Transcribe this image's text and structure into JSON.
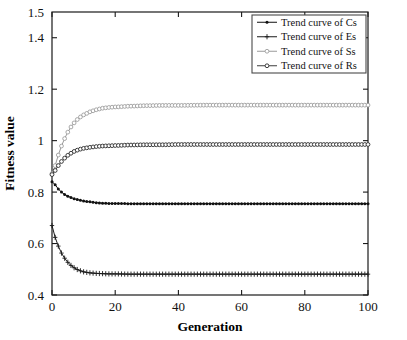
{
  "chart_data": {
    "type": "line",
    "title": "",
    "xlabel": "Generation",
    "ylabel": "Fitness value",
    "xlim": [
      0,
      100
    ],
    "ylim": [
      0.4,
      1.5
    ],
    "xticks": [
      0,
      20,
      40,
      60,
      80,
      100
    ],
    "xtick_labels": [
      "0",
      "20",
      "40",
      "60",
      "80",
      "100"
    ],
    "yticks": [
      0.4,
      0.6,
      0.8,
      1.0,
      1.2,
      1.4,
      1.5
    ],
    "ytick_labels": [
      "0.4",
      "0.6",
      "0.8",
      "1",
      "1.2",
      "1.4",
      "1.5"
    ],
    "grid": false,
    "legend_position": "upper right",
    "x": [
      0,
      1,
      2,
      3,
      4,
      5,
      6,
      7,
      8,
      9,
      10,
      12,
      14,
      16,
      18,
      20,
      25,
      30,
      35,
      40,
      50,
      60,
      70,
      80,
      90,
      100
    ],
    "series": [
      {
        "name": "Trend curve of Cs",
        "short_name": "Cs",
        "marker": "filled-dot",
        "color": "#111111",
        "values": [
          0.84,
          0.829,
          0.812,
          0.8,
          0.791,
          0.784,
          0.779,
          0.774,
          0.771,
          0.768,
          0.765,
          0.762,
          0.759,
          0.757,
          0.756,
          0.756,
          0.755,
          0.755,
          0.755,
          0.755,
          0.755,
          0.755,
          0.755,
          0.755,
          0.755,
          0.755
        ]
      },
      {
        "name": "Trend curve of Es",
        "short_name": "Es",
        "marker": "plus",
        "color": "#1a1a1a",
        "values": [
          0.67,
          0.624,
          0.59,
          0.563,
          0.543,
          0.527,
          0.515,
          0.506,
          0.499,
          0.494,
          0.49,
          0.486,
          0.484,
          0.483,
          0.482,
          0.482,
          0.481,
          0.481,
          0.481,
          0.481,
          0.481,
          0.481,
          0.481,
          0.481,
          0.481,
          0.481
        ]
      },
      {
        "name": "Trend curve of Ss",
        "short_name": "Ss",
        "marker": "open-circle-light",
        "color": "#9a9a9a",
        "values": [
          0.872,
          0.903,
          0.944,
          0.979,
          1.008,
          1.033,
          1.053,
          1.069,
          1.082,
          1.092,
          1.1,
          1.112,
          1.12,
          1.126,
          1.129,
          1.131,
          1.134,
          1.136,
          1.137,
          1.137,
          1.138,
          1.138,
          1.138,
          1.138,
          1.138,
          1.138
        ]
      },
      {
        "name": "Trend curve of Rs",
        "short_name": "Rs",
        "marker": "open-circle-dark",
        "color": "#3c3c3c",
        "values": [
          0.868,
          0.884,
          0.903,
          0.919,
          0.932,
          0.943,
          0.951,
          0.958,
          0.963,
          0.967,
          0.97,
          0.974,
          0.977,
          0.979,
          0.98,
          0.981,
          0.983,
          0.984,
          0.984,
          0.985,
          0.985,
          0.985,
          0.985,
          0.985,
          0.985,
          0.985
        ]
      }
    ],
    "legend_entries": [
      "Trend curve of Cs",
      "Trend curve of Es",
      "Trend curve of Ss",
      "Trend curve of Rs"
    ]
  },
  "geometry": {
    "plot_left": 52,
    "plot_right": 368,
    "plot_top": 12,
    "plot_bottom": 295,
    "legend_left": 252,
    "legend_top": 15,
    "legend_width": 114,
    "legend_height": 58
  }
}
